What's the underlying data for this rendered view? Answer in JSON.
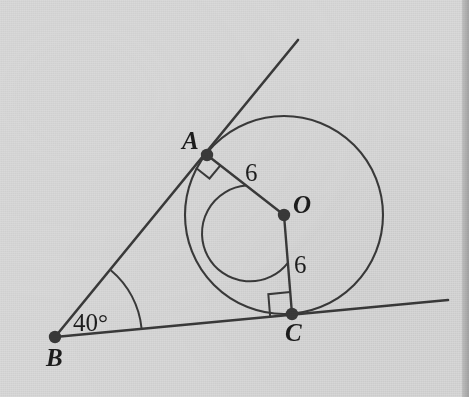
{
  "figure": {
    "kind": "geometry-diagram",
    "background_color": "#d9d9d9",
    "ink_color": "#3a3a3a",
    "label_color": "#1d1d1d"
  },
  "points": {
    "A": {
      "label": "A",
      "x": 207,
      "y": 155,
      "label_x": 182,
      "label_y": 128
    },
    "B": {
      "label": "B",
      "x": 55,
      "y": 337,
      "label_x": 46,
      "label_y": 345
    },
    "C": {
      "label": "C",
      "x": 292,
      "y": 314,
      "label_x": 285,
      "label_y": 320
    },
    "O": {
      "label": "O",
      "x": 284,
      "y": 215,
      "label_x": 293,
      "label_y": 192
    }
  },
  "circle": {
    "center_x": 284,
    "center_y": 215,
    "radius": 99
  },
  "segments": {
    "ray_BA": {
      "x1": 55,
      "y1": 337,
      "x2": 298,
      "y2": 40
    },
    "ray_BC": {
      "x1": 55,
      "y1": 337,
      "x2": 448,
      "y2": 300
    },
    "radius_OA": {
      "x1": 284,
      "y1": 215,
      "x2": 207,
      "y2": 155
    },
    "radius_OC": {
      "x1": 284,
      "y1": 215,
      "x2": 292,
      "y2": 314
    }
  },
  "labels": {
    "radius_OA_length": "6",
    "radius_OC_length": "6",
    "angle_B": "40°"
  },
  "marks": {
    "right_angle_at_A": "right-angle-square",
    "right_angle_at_C": "right-angle-square",
    "angle_arc_at_B": "arc-40-degrees",
    "angle_arc_at_O": "arc-reflex-AOC"
  },
  "label_positions": {
    "len_OA_x": 245,
    "len_OA_y": 160,
    "len_OC_x": 294,
    "len_OC_y": 252,
    "angle_B_x": 73,
    "angle_B_y": 310
  }
}
